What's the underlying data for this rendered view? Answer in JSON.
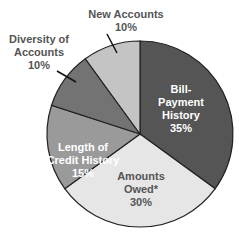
{
  "chart_data": {
    "type": "pie",
    "title": "",
    "start_angle": "12 o'clock",
    "direction": "clockwise",
    "slices": [
      {
        "label": "Bill-Payment History",
        "value": 35,
        "value_label": "35%",
        "color": "#555555",
        "text_color": "#ffffff",
        "lines": [
          "Bill-",
          "Payment",
          "History",
          "35%"
        ]
      },
      {
        "label": "Amounts Owed*",
        "value": 30,
        "value_label": "30%",
        "color": "#e6e6e6",
        "text_color": "#555555",
        "lines": [
          "Amounts",
          "Owed*",
          "30%"
        ]
      },
      {
        "label": "Length of Credit History",
        "value": 15,
        "value_label": "15%",
        "color": "#9a9a9a",
        "text_color": "#ffffff",
        "lines": [
          "Length of",
          "Credit History",
          "15%"
        ]
      },
      {
        "label": "Diversity of Accounts",
        "value": 10,
        "value_label": "10%",
        "color": "#737373",
        "text_color": "#555555",
        "lines": [
          "Diversity of",
          "Accounts",
          "10%"
        ]
      },
      {
        "label": "New Accounts",
        "value": 10,
        "value_label": "10%",
        "color": "#c4c4c4",
        "text_color": "#555555",
        "lines": [
          "New Accounts",
          "10%"
        ]
      }
    ],
    "legend": "none"
  }
}
